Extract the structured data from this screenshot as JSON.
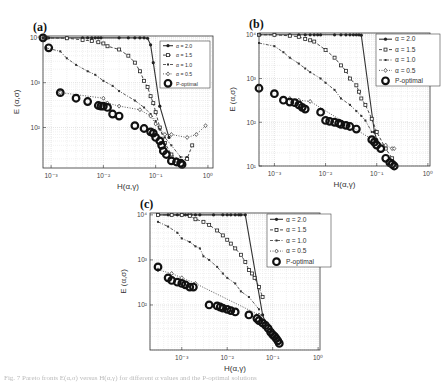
{
  "figure": {
    "caption": "Fig. 7 Pareto fronts E(α,σ) versus H(α,γ) for different α values and the P-optimal solutions"
  },
  "chart_data": [
    {
      "type": "scatter",
      "panel_label": "(a)",
      "title": "",
      "xlabel": "H(α,γ)",
      "ylabel": "E (α,σ)",
      "xscale": "log",
      "yscale": "log",
      "xlim": [
        0.0007,
        1.25
      ],
      "ylim": [
        12.5,
        11000
      ],
      "xticks": [
        "10^-3",
        "10^-2",
        "10^-1",
        "10^0"
      ],
      "yticks": [
        "10^2",
        "10^3",
        "10^4"
      ],
      "grid": true,
      "legend": [
        "α = 2.0",
        "α = 1.5",
        "α = 1.0",
        "α = 0.5",
        "P-optimal"
      ],
      "legend_position": "upper right",
      "series": [
        {
          "name": "α = 2.0",
          "style": "solid-circle",
          "x": [
            0.0007,
            0.0009,
            0.002,
            0.004,
            0.005,
            0.006,
            0.007,
            0.008,
            0.009,
            0.02,
            0.03,
            0.04,
            0.05,
            0.06,
            0.07,
            0.08,
            0.09,
            0.12,
            0.18
          ],
          "y": [
            10000,
            10000,
            10000,
            10000,
            10000,
            10000,
            10000,
            10000,
            10000,
            10000,
            10000,
            10000,
            10000,
            10000,
            9800,
            7000,
            2800,
            300,
            60
          ]
        },
        {
          "name": "α = 1.5",
          "style": "dashed-square",
          "x": [
            0.0008,
            0.002,
            0.004,
            0.006,
            0.008,
            0.01,
            0.012,
            0.02,
            0.03,
            0.04,
            0.05,
            0.06,
            0.07,
            0.08,
            0.09,
            0.1,
            0.12,
            0.15,
            0.2,
            0.3,
            0.4,
            0.5
          ],
          "y": [
            10000,
            9800,
            9000,
            8500,
            8000,
            7500,
            6500,
            5500,
            4000,
            2800,
            1800,
            1100,
            800,
            500,
            350,
            220,
            100,
            45,
            25,
            18,
            20,
            40
          ]
        },
        {
          "name": "α = 1.0",
          "style": "dashdot-star",
          "x": [
            0.0008,
            0.0015,
            0.002,
            0.003,
            0.005,
            0.007,
            0.01,
            0.015,
            0.02,
            0.04,
            0.06,
            0.08,
            0.1,
            0.12,
            0.15,
            0.2,
            0.3,
            0.4
          ],
          "y": [
            6000,
            5000,
            3500,
            2500,
            1800,
            1500,
            1100,
            850,
            650,
            400,
            280,
            200,
            140,
            90,
            60,
            40,
            22,
            22
          ]
        },
        {
          "name": "α = 0.5",
          "style": "dotted-diamond",
          "x": [
            0.0015,
            0.01,
            0.012,
            0.02,
            0.05,
            0.08,
            0.1,
            0.15,
            0.2,
            0.4,
            0.6,
            0.9
          ],
          "y": [
            600,
            450,
            350,
            300,
            250,
            180,
            120,
            70,
            70,
            60,
            70,
            110
          ]
        },
        {
          "name": "P-optimal",
          "style": "open-circle",
          "x": [
            0.0007,
            0.0009,
            0.0015,
            0.003,
            0.005,
            0.008,
            0.009,
            0.01,
            0.012,
            0.015,
            0.02,
            0.04,
            0.06,
            0.08,
            0.09,
            0.1,
            0.12,
            0.13,
            0.14,
            0.16,
            0.2,
            0.25,
            0.3,
            0.32
          ],
          "y": [
            10000,
            6000,
            600,
            450,
            380,
            310,
            300,
            300,
            280,
            200,
            180,
            110,
            95,
            80,
            75,
            60,
            50,
            40,
            30,
            25,
            18,
            17,
            16,
            15
          ]
        }
      ]
    },
    {
      "type": "scatter",
      "panel_label": "(b)",
      "title": "",
      "xlabel": "H(α,γ)",
      "ylabel": "E (α,σ)",
      "xscale": "log",
      "yscale": "log",
      "xlim": [
        0.0005,
        1.1
      ],
      "ylim": [
        10,
        11000
      ],
      "xticks": [
        "10^-3",
        "10^-2",
        "10^-1",
        "10^0"
      ],
      "yticks": [
        "10^1",
        "10^2",
        "10^3",
        "10^4"
      ],
      "grid": true,
      "legend": [
        "α = 2.0",
        "α = 1.5",
        "α = 1.0",
        "α = 0.5",
        "P-optimal"
      ],
      "legend_position": "upper right",
      "series": [
        {
          "name": "α = 2.0",
          "style": "solid-circle",
          "x": [
            0.0005,
            0.001,
            0.002,
            0.003,
            0.004,
            0.005,
            0.006,
            0.007,
            0.008,
            0.015,
            0.02,
            0.025,
            0.03,
            0.035,
            0.04,
            0.045,
            0.05,
            0.09,
            0.1
          ],
          "y": [
            10000,
            10000,
            10000,
            10000,
            10000,
            10000,
            10000,
            10000,
            10000,
            10000,
            10000,
            10000,
            10000,
            10000,
            10000,
            10000,
            9800,
            60,
            40
          ]
        },
        {
          "name": "α = 1.5",
          "style": "dashed-square",
          "x": [
            0.0005,
            0.001,
            0.002,
            0.003,
            0.004,
            0.005,
            0.006,
            0.01,
            0.015,
            0.02,
            0.025,
            0.03,
            0.04,
            0.045,
            0.05,
            0.06,
            0.08,
            0.1,
            0.15,
            0.2
          ],
          "y": [
            10000,
            10000,
            9500,
            9000,
            8000,
            7500,
            7000,
            4500,
            3000,
            2000,
            1500,
            1000,
            700,
            500,
            350,
            250,
            120,
            60,
            25,
            15
          ]
        },
        {
          "name": "α = 1.0",
          "style": "dashdot-star",
          "x": [
            0.0005,
            0.001,
            0.0015,
            0.002,
            0.003,
            0.004,
            0.005,
            0.008,
            0.01,
            0.015,
            0.02,
            0.03,
            0.04,
            0.05,
            0.06,
            0.08
          ],
          "y": [
            6500,
            5500,
            4000,
            3000,
            2200,
            1700,
            1400,
            1000,
            800,
            550,
            350,
            250,
            180,
            140,
            110,
            60
          ]
        },
        {
          "name": "α = 0.5",
          "style": "dotted-diamond",
          "x": [
            0.002,
            0.003,
            0.005,
            0.1,
            0.15,
            0.2,
            0.22
          ],
          "y": [
            350,
            320,
            300,
            35,
            30,
            25,
            25
          ]
        },
        {
          "name": "P-optimal",
          "style": "open-circle",
          "x": [
            0.0005,
            0.001,
            0.0015,
            0.002,
            0.0025,
            0.003,
            0.0035,
            0.004,
            0.008,
            0.01,
            0.012,
            0.015,
            0.018,
            0.02,
            0.025,
            0.03,
            0.04,
            0.08,
            0.09,
            0.1,
            0.12,
            0.15,
            0.18,
            0.2,
            0.22
          ],
          "y": [
            600,
            450,
            320,
            290,
            280,
            250,
            220,
            200,
            170,
            110,
            105,
            100,
            95,
            90,
            85,
            80,
            70,
            40,
            35,
            30,
            25,
            15,
            12,
            11,
            10
          ]
        }
      ]
    },
    {
      "type": "scatter",
      "panel_label": "(c)",
      "title": "",
      "xlabel": "H(α,γ)",
      "ylabel": "E (α,σ)",
      "xscale": "log",
      "yscale": "log",
      "xlim": [
        0.0002,
        1.1
      ],
      "ylim": [
        10,
        11000
      ],
      "xticks": [
        "10^-3",
        "10^-2",
        "10^-1",
        "10^0"
      ],
      "yticks": [
        "10^2",
        "10^3",
        "10^4"
      ],
      "grid": true,
      "legend": [
        "α = 2.0",
        "α = 1.5",
        "α = 1.0",
        "α = 0.5",
        "P-optimal"
      ],
      "legend_position": "upper right",
      "series": [
        {
          "name": "α = 2.0",
          "style": "solid-circle",
          "x": [
            0.0003,
            0.0005,
            0.0008,
            0.001,
            0.0012,
            0.0014,
            0.0016,
            0.002,
            0.0025,
            0.005,
            0.008,
            0.01,
            0.012,
            0.015,
            0.018,
            0.02,
            0.025,
            0.06,
            0.07
          ],
          "y": [
            10000,
            10000,
            10000,
            10000,
            10000,
            10000,
            10000,
            10000,
            10000,
            10000,
            10000,
            10000,
            10000,
            10000,
            10000,
            10000,
            10000,
            60,
            40
          ]
        },
        {
          "name": "α = 1.5",
          "style": "dashed-square",
          "x": [
            0.0003,
            0.0006,
            0.001,
            0.0015,
            0.002,
            0.003,
            0.004,
            0.006,
            0.008,
            0.01,
            0.012,
            0.015,
            0.02,
            0.025,
            0.03,
            0.035,
            0.04,
            0.05,
            0.06
          ],
          "y": [
            10000,
            10000,
            10000,
            9500,
            8000,
            7000,
            6000,
            4500,
            3500,
            2800,
            2300,
            1800,
            1300,
            900,
            600,
            500,
            400,
            250,
            150
          ]
        },
        {
          "name": "α = 1.0",
          "style": "dashdot-star",
          "x": [
            0.0003,
            0.0005,
            0.0008,
            0.001,
            0.0015,
            0.002,
            0.0025,
            0.003,
            0.004,
            0.006,
            0.008,
            0.01,
            0.015,
            0.02,
            0.03,
            0.05
          ],
          "y": [
            7000,
            5500,
            4000,
            3000,
            2500,
            2000,
            1800,
            1200,
            1000,
            700,
            500,
            400,
            300,
            200,
            150,
            80
          ]
        },
        {
          "name": "α = 0.5",
          "style": "dotted-diamond",
          "x": [
            0.0003,
            0.0006,
            0.001,
            0.002,
            0.05
          ],
          "y": [
            600,
            500,
            400,
            300,
            60
          ]
        },
        {
          "name": "P-optimal",
          "style": "open-circle",
          "x": [
            0.0003,
            0.0005,
            0.0006,
            0.0008,
            0.001,
            0.0012,
            0.0015,
            0.0018,
            0.004,
            0.006,
            0.007,
            0.008,
            0.01,
            0.012,
            0.015,
            0.03,
            0.045,
            0.05,
            0.06,
            0.07,
            0.08,
            0.09,
            0.1,
            0.11,
            0.12,
            0.13,
            0.14
          ],
          "y": [
            700,
            400,
            350,
            320,
            300,
            280,
            250,
            250,
            100,
            95,
            90,
            85,
            80,
            75,
            70,
            60,
            50,
            45,
            40,
            35,
            30,
            25,
            22,
            20,
            18,
            16,
            14
          ]
        }
      ]
    }
  ],
  "panels": [
    {
      "label": "(a)",
      "box": {
        "left": 43,
        "top": 36,
        "right": 213,
        "bottom": 168
      },
      "legend_box": {
        "x": 160,
        "y": 41,
        "w": 50,
        "h": 47
      }
    },
    {
      "label": "(b)",
      "box": {
        "left": 259,
        "top": 33,
        "right": 430,
        "bottom": 166
      },
      "legend_box": {
        "x": 376,
        "y": 34,
        "w": 64,
        "h": 52
      }
    },
    {
      "label": "(c)",
      "box": {
        "left": 150,
        "top": 213,
        "right": 320,
        "bottom": 350
      },
      "legend_box": {
        "x": 267,
        "y": 214,
        "w": 64,
        "h": 53
      }
    }
  ]
}
